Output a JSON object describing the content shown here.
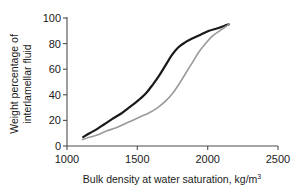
{
  "chart_data": {
    "type": "line",
    "title": "",
    "xlabel": "Bulk density at water saturation, kg/m",
    "xlabel_superscript": "3",
    "ylabel_line1": "Weight percentage of",
    "ylabel_line2": "interlamellar fluid",
    "xlim": [
      1000,
      2500
    ],
    "ylim": [
      0,
      100
    ],
    "xticks": [
      1000,
      1500,
      2000,
      2500
    ],
    "xtick_labels": [
      "1000",
      "1500",
      "2000",
      "2500"
    ],
    "yticks": [
      0,
      20,
      40,
      60,
      80,
      100
    ],
    "ytick_labels": [
      "0",
      "20",
      "40",
      "60",
      "80",
      "100"
    ],
    "grid": false,
    "legend": "none",
    "spines": [
      "left",
      "bottom"
    ],
    "series": [
      {
        "name": "upper-curve",
        "color": "#1a1a1a",
        "linewidth": 2.2,
        "x": [
          1115,
          1160,
          1210,
          1265,
          1320,
          1380,
          1440,
          1500,
          1560,
          1610,
          1655,
          1700,
          1745,
          1790,
          1840,
          1890,
          1950,
          2010,
          2070,
          2120,
          2150
        ],
        "y": [
          7,
          10,
          13,
          17,
          21,
          25,
          30,
          35,
          41,
          48,
          55,
          63,
          71,
          77,
          81,
          84,
          87,
          90,
          92,
          94,
          95
        ]
      },
      {
        "name": "lower-curve",
        "color": "#9a9a9a",
        "linewidth": 1.6,
        "x": [
          1110,
          1165,
          1225,
          1285,
          1345,
          1405,
          1465,
          1525,
          1585,
          1645,
          1700,
          1750,
          1800,
          1845,
          1890,
          1935,
          1985,
          2035,
          2085,
          2125,
          2150
        ],
        "y": [
          5,
          7,
          9,
          12,
          14,
          17,
          20,
          23,
          26,
          30,
          35,
          41,
          49,
          57,
          65,
          73,
          80,
          86,
          90,
          93,
          95
        ]
      }
    ]
  }
}
